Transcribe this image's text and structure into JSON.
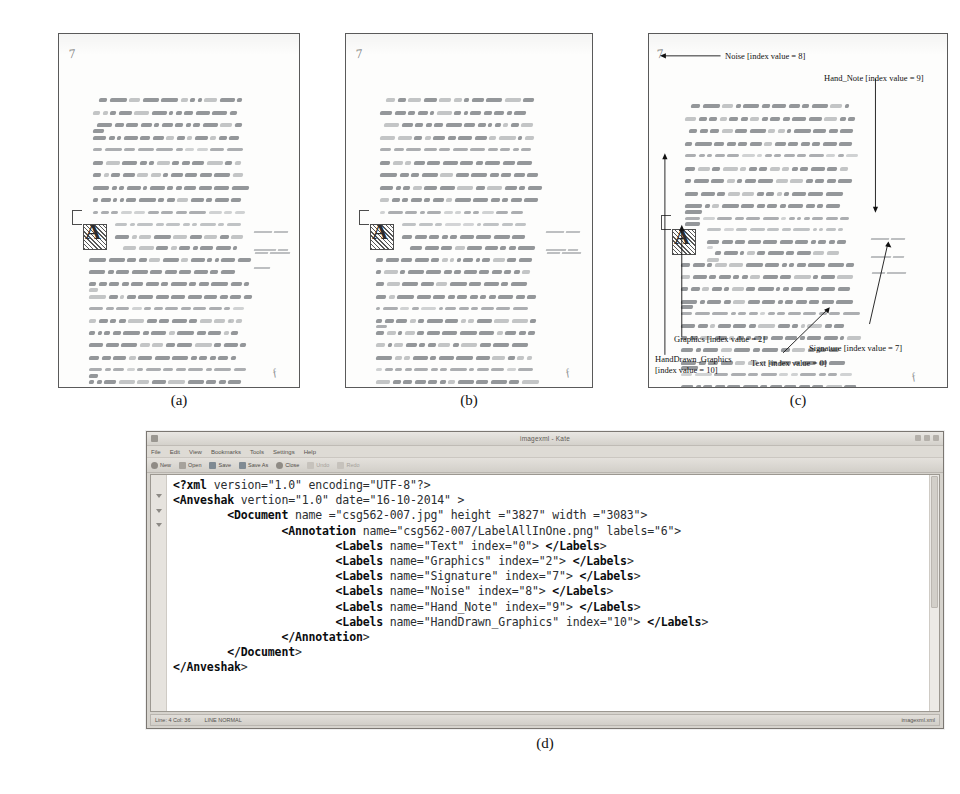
{
  "figure": {
    "subfigures": [
      {
        "id": "a",
        "caption": "(a)",
        "description": "Original manuscript page image"
      },
      {
        "id": "b",
        "caption": "(b)",
        "description": "Binarized / cleaned manuscript page image"
      },
      {
        "id": "c",
        "caption": "(c)",
        "description": "Annotated manuscript page with labelled regions"
      },
      {
        "id": "d",
        "caption": "(d)",
        "description": "XML ground-truth file opened in Kate text editor"
      }
    ]
  },
  "annotations": [
    {
      "name": "Noise",
      "index": "8",
      "label": "Noise [index value = 8]"
    },
    {
      "name": "Hand_Note",
      "index": "9",
      "label": "Hand_Note [index value = 9]"
    },
    {
      "name": "Graphics",
      "index": "2",
      "label": "Graphics [index value = 2]"
    },
    {
      "name": "HandDrawn_Graphics",
      "index": "10",
      "label": "HandDrawn_Graphics"
    },
    {
      "name": "HandDrawn_Graphics2",
      "index": "10",
      "label": "[index value = 10]"
    },
    {
      "name": "Signature",
      "index": "7",
      "label": "Signature [index value = 7]"
    },
    {
      "name": "Text",
      "index": "0",
      "label": "Text [index value = 0]"
    }
  ],
  "manuscript": {
    "folio_number": "7"
  },
  "editor": {
    "app_icon": "document-icon",
    "title": "imagexml - Kate",
    "window_controls": [
      "minimize-button",
      "maximize-button",
      "close-button"
    ],
    "menus": [
      "File",
      "Edit",
      "View",
      "Bookmarks",
      "Tools",
      "Settings",
      "Help"
    ],
    "toolbar": [
      {
        "icon": "new-file-icon",
        "label": "New"
      },
      {
        "icon": "open-folder-icon",
        "label": "Open"
      },
      {
        "icon": "save-icon",
        "label": "Save"
      },
      {
        "icon": "save-as-icon",
        "label": "Save As"
      },
      {
        "icon": "close-icon",
        "label": "Close"
      },
      {
        "icon": "undo-icon",
        "label": "Undo"
      },
      {
        "icon": "redo-icon",
        "label": "Redo"
      }
    ],
    "statusbar": {
      "position": "Line: 4 Col: 36",
      "mode": "LINE  NORMAL",
      "doc_type": "imagexml.xml"
    },
    "xml_lines": [
      "<?xml version=\"1.0\" encoding=\"UTF-8\"?>",
      "<Anveshak vertion=\"1.0\" date=\"16-10-2014\" >",
      "        <Document name =\"csg562-007.jpg\" height =\"3827\" width =\"3083\">",
      "                <Annotation name=\"csg562-007/LabelAllInOne.png\" labels=\"6\">",
      "                        <Labels name=\"Text\" index=\"0\"> </Labels>",
      "                        <Labels name=\"Graphics\" index=\"2\"> </Labels>",
      "                        <Labels name=\"Signature\" index=\"7\"> </Labels>",
      "                        <Labels name=\"Noise\" index=\"8\"> </Labels>",
      "                        <Labels name=\"Hand_Note\" index=\"9\"> </Labels>",
      "                        <Labels name=\"HandDrawn_Graphics\" index=\"10\"> </Labels>",
      "                </Annotation>",
      "        </Document>",
      "</Anveshak>"
    ],
    "xml_document": {
      "xml_version": "1.0",
      "encoding": "UTF-8",
      "root_element": "Anveshak",
      "root_vertion": "1.0",
      "root_date": "16-10-2014",
      "document_name": "csg562-007.jpg",
      "document_height": "3827",
      "document_width": "3083",
      "annotation_name": "csg562-007/LabelAllInOne.png",
      "annotation_labels": "6",
      "labels": [
        {
          "name": "Text",
          "index": "0"
        },
        {
          "name": "Graphics",
          "index": "2"
        },
        {
          "name": "Signature",
          "index": "7"
        },
        {
          "name": "Noise",
          "index": "8"
        },
        {
          "name": "Hand_Note",
          "index": "9"
        },
        {
          "name": "HandDrawn_Graphics",
          "index": "10"
        }
      ]
    }
  },
  "colors": {
    "page_background": "#ffffff",
    "panel_border": "#5a5a5a",
    "ink": "#6d7175",
    "window_chrome": "#d6d3cd",
    "editor_background": "#ffffff",
    "code_text": "#16181a"
  }
}
